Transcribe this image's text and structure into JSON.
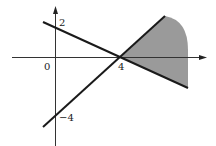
{
  "figure": {
    "type": "coordinate-graph",
    "axes": {
      "x_axis": {
        "arrow": true
      },
      "y_axis": {
        "arrow": true
      }
    },
    "labels": {
      "origin": "0",
      "y_intercept_top": "2",
      "x_intercept": "4",
      "y_intercept_bottom": "−4"
    },
    "lines": [
      {
        "name": "decreasing-line",
        "through": [
          [
            0,
            2
          ],
          [
            4,
            0
          ]
        ],
        "equation": "x + 2y = 4"
      },
      {
        "name": "increasing-line",
        "through": [
          [
            0,
            -4
          ],
          [
            4,
            0
          ]
        ],
        "equation": "y = x - 4"
      }
    ],
    "shaded_region": {
      "vertex": [
        4,
        0
      ],
      "bounded_by": [
        "decreasing-line",
        "increasing-line"
      ],
      "side": "right of x = 4",
      "fill_color": "#999999"
    },
    "colors": {
      "line": "#1a1a1a",
      "axis": "#333333",
      "shade": "#9a9a9a"
    }
  }
}
